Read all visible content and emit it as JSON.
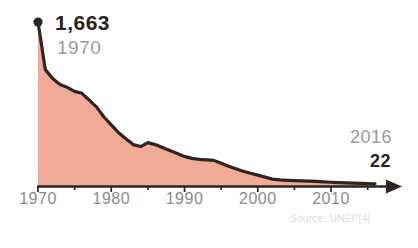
{
  "chart_data": {
    "type": "area",
    "title": "",
    "subtitle": "",
    "xlabel": "",
    "ylabel": "",
    "xlim": [
      1970,
      2016
    ],
    "ylim": [
      0,
      1663
    ],
    "grid": false,
    "legend": null,
    "source": "Source: UNEP[4]",
    "series": [
      {
        "name": "Annual consumption",
        "x": [
          1970,
          1971,
          1972,
          1973,
          1974,
          1975,
          1976,
          1977,
          1978,
          1979,
          1980,
          1981,
          1982,
          1983,
          1984,
          1985,
          1986,
          1987,
          1988,
          1989,
          1990,
          1991,
          1992,
          1993,
          1994,
          1995,
          1996,
          1997,
          1998,
          1999,
          2000,
          2001,
          2002,
          2003,
          2004,
          2005,
          2006,
          2007,
          2008,
          2009,
          2010,
          2011,
          2012,
          2013,
          2014,
          2015,
          2016
        ],
        "values": [
          1663,
          1180,
          1090,
          1030,
          1000,
          960,
          940,
          870,
          800,
          700,
          620,
          540,
          480,
          420,
          400,
          440,
          420,
          390,
          360,
          330,
          300,
          280,
          270,
          265,
          260,
          230,
          200,
          175,
          150,
          130,
          110,
          90,
          70,
          62,
          58,
          55,
          52,
          50,
          46,
          42,
          38,
          35,
          32,
          29,
          27,
          24,
          22
        ]
      }
    ],
    "x_ticks_major": [
      1970,
      1980,
      1990,
      2000,
      2010
    ],
    "x_tick_labels": [
      "1970",
      "1980",
      "1990",
      "2000",
      "2010"
    ],
    "x_ticks_minor": [
      1975,
      1985,
      1995,
      2005,
      2015
    ],
    "annotations": {
      "peak": {
        "value_label": "1,663",
        "year_label": "1970",
        "marker": "dot"
      },
      "end": {
        "value_label": "22",
        "year_label": "2016"
      }
    },
    "colors": {
      "area_fill": "#efab95",
      "line_stroke": "#2e2420",
      "axis": "#2e2420",
      "value_text": "#2b2320",
      "year_text": "#9c9a99",
      "tick_text": "#8d8a89",
      "source_text": "#dedbda",
      "background": "#ffffff"
    }
  },
  "icons": {
    "axis_arrow": "arrow-right",
    "peak_marker": "dot-marker"
  }
}
